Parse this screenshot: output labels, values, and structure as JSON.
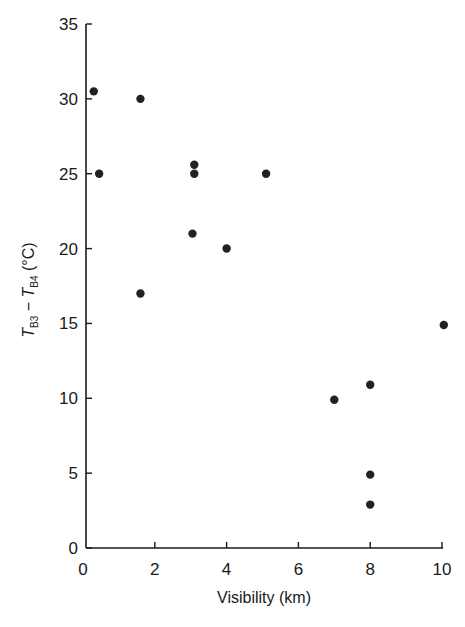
{
  "chart_data": {
    "type": "scatter",
    "title": "",
    "xlabel": "Visibility (km)",
    "ylabel": "T_B3 − T_B4 (°C)",
    "ylabel_parts": {
      "t1": "T",
      "s1": "B3",
      "dash": " − ",
      "t2": "T",
      "s2": "B4",
      "unit": " (°C)"
    },
    "xlim": [
      0,
      10
    ],
    "ylim": [
      0,
      35
    ],
    "xticks": [
      0,
      2,
      4,
      6,
      8,
      10
    ],
    "yticks": [
      0,
      5,
      10,
      15,
      20,
      25,
      30,
      35
    ],
    "grid": false,
    "legend": null,
    "marker_color": "#222222",
    "points": [
      {
        "x": 0.3,
        "y": 30.5
      },
      {
        "x": 1.6,
        "y": 30.0
      },
      {
        "x": 0.45,
        "y": 25.0
      },
      {
        "x": 3.1,
        "y": 25.6
      },
      {
        "x": 3.1,
        "y": 25.0
      },
      {
        "x": 5.1,
        "y": 25.0
      },
      {
        "x": 3.05,
        "y": 21.0
      },
      {
        "x": 4.0,
        "y": 20.0
      },
      {
        "x": 1.6,
        "y": 17.0
      },
      {
        "x": 10.05,
        "y": 14.9
      },
      {
        "x": 8.0,
        "y": 10.9
      },
      {
        "x": 7.0,
        "y": 9.9
      },
      {
        "x": 8.0,
        "y": 4.9
      },
      {
        "x": 8.0,
        "y": 2.9
      }
    ]
  }
}
